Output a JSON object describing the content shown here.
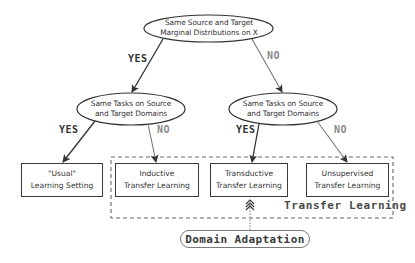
{
  "diagram": {
    "root": {
      "line1": "Same Source and Target",
      "line2": "Marginal Distributions on X"
    },
    "left_decision": {
      "line1": "Same Tasks on Source",
      "line2": "and Target Domains"
    },
    "right_decision": {
      "line1": "Same Tasks on Source",
      "line2": "and Target Domains"
    },
    "branch_labels": {
      "root_yes": "YES",
      "root_no": "NO",
      "left_yes": "YES",
      "left_no": "NO",
      "right_yes": "YES",
      "right_no": "NO"
    },
    "leaves": [
      {
        "line1": "\"Usual\"",
        "line2": "Learning Setting"
      },
      {
        "line1": "Inductive",
        "line2": "Transfer Learning"
      },
      {
        "line1": "Transductive",
        "line2": "Transfer Learning"
      },
      {
        "line1": "Unsupervised",
        "line2": "Transfer Learning"
      }
    ],
    "region_label": "Transfer Learning",
    "domain_adaptation_label": "Domain Adaptation",
    "colors": {
      "stroke": "#3a3a3a",
      "no_branch": "#8a8a8a",
      "dashed_region": "#666666"
    }
  }
}
